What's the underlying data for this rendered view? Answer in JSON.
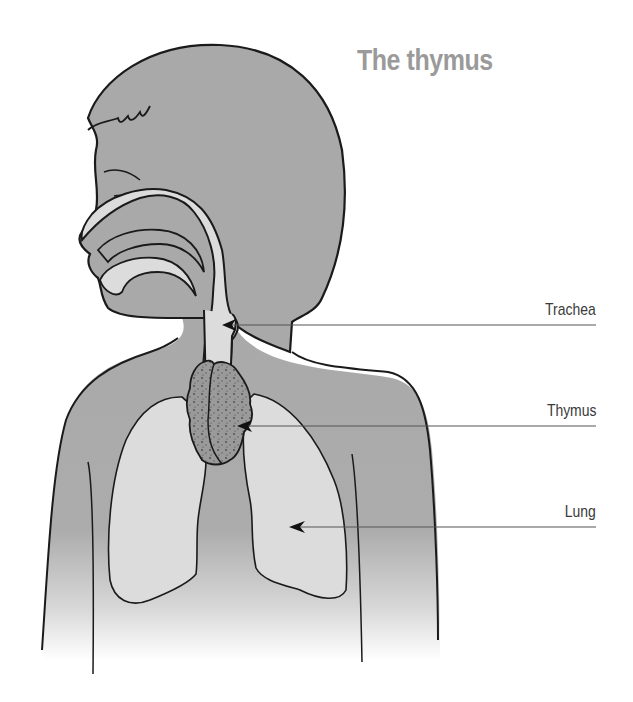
{
  "title": "The thymus",
  "labels": [
    {
      "id": "trachea",
      "text": "Trachea",
      "line_y": 325,
      "arrow_x": 222
    },
    {
      "id": "thymus",
      "text": "Thymus",
      "line_y": 426,
      "arrow_x": 237
    },
    {
      "id": "lung",
      "text": "Lung",
      "line_y": 527,
      "arrow_x": 289
    }
  ],
  "colors": {
    "body_fill": "#a9a9a9",
    "organ_fill": "#dcdcdc",
    "thymus_fill": "#8e8e8e",
    "outline": "#1a1a1a",
    "title": "#9a9a9a",
    "label_text": "#3a3a3a",
    "leader_line": "#555555"
  }
}
